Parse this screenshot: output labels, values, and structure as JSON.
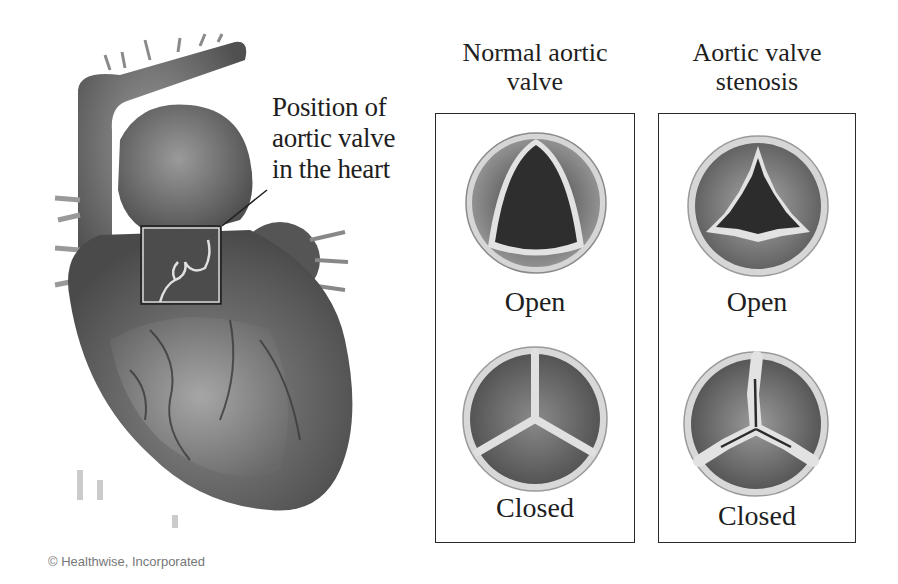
{
  "figure": {
    "callout_label": [
      "Position of",
      "aortic valve",
      "in the heart"
    ],
    "columns": [
      {
        "title": [
          "Normal aortic",
          "valve"
        ],
        "states": [
          {
            "label": "Open",
            "illustration": "normal-valve-open"
          },
          {
            "label": "Closed",
            "illustration": "normal-valve-closed"
          }
        ]
      },
      {
        "title": [
          "Aortic valve",
          "stenosis"
        ],
        "states": [
          {
            "label": "Open",
            "illustration": "stenosis-valve-open"
          },
          {
            "label": "Closed",
            "illustration": "stenosis-valve-closed"
          }
        ]
      }
    ],
    "copyright": "© Healthwise, Incorporated",
    "colors": {
      "background": "#ffffff",
      "panel_border": "#2a2a2a",
      "tissue_dark": "#3a3a3a",
      "tissue_mid": "#7a7a7a",
      "tissue_light": "#bdbdbd",
      "leaflet_edge": "#e6e6e6"
    }
  }
}
